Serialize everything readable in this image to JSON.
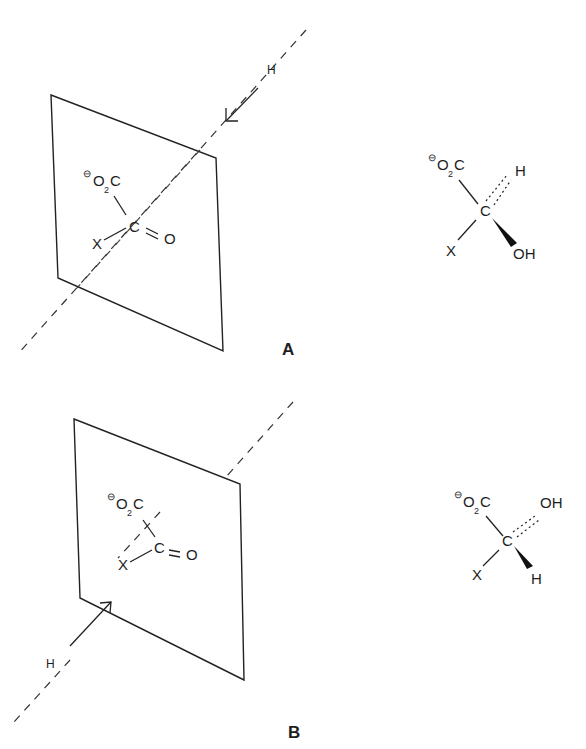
{
  "figure": {
    "panels": [
      {
        "id": "A",
        "label": "A",
        "attack_label": "H",
        "attack_direction": "from back (upper right) toward plane",
        "planar_substrate": {
          "charge": "⊖",
          "carboxylate_O": "O",
          "carboxylate_sub": "2",
          "carboxylate_C": "C",
          "center": "C",
          "carbonyl_O": "O",
          "substituent": "X"
        },
        "product": {
          "charge": "⊖",
          "carboxylate_O": "O",
          "carboxylate_sub": "2",
          "carboxylate_C": "C",
          "center": "C",
          "hashed_group": "H",
          "wedge_group": "OH",
          "substituent": "X"
        }
      },
      {
        "id": "B",
        "label": "B",
        "attack_label": "H",
        "attack_direction": "from front (lower left) toward plane",
        "planar_substrate": {
          "charge": "⊖",
          "carboxylate_O": "O",
          "carboxylate_sub": "2",
          "carboxylate_C": "C",
          "center": "C",
          "carbonyl_O": "O",
          "substituent": "X"
        },
        "product": {
          "charge": "⊖",
          "carboxylate_O": "O",
          "carboxylate_sub": "2",
          "carboxylate_C": "C",
          "center": "C",
          "hashed_group": "OH",
          "wedge_group": "H",
          "substituent": "X"
        }
      }
    ]
  }
}
